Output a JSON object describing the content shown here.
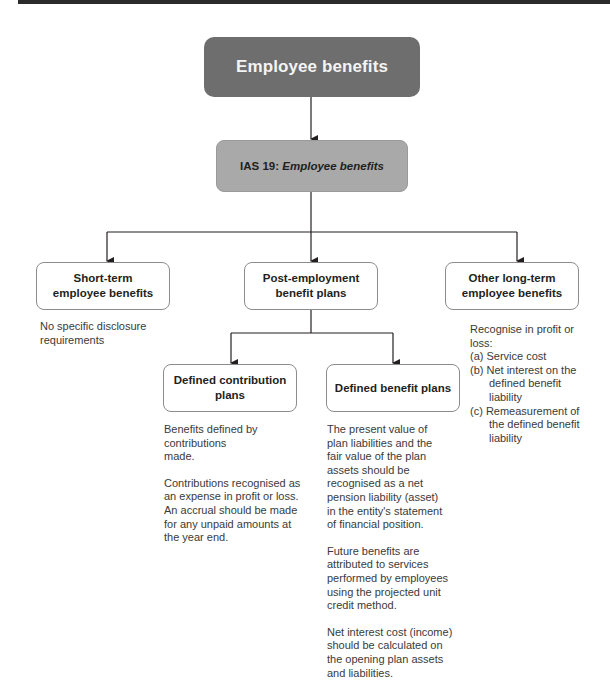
{
  "diagram": {
    "root": {
      "label": "Employee benefits"
    },
    "standard": {
      "prefix": "IAS 19: ",
      "title_italic": "Employee benefits"
    },
    "categories": [
      {
        "label": "Short-term employee benefits",
        "description": [
          "No specific disclosure requirements"
        ]
      },
      {
        "label": "Post-employment benefit plans",
        "children": [
          {
            "label": "Defined contribution plans",
            "description": [
              "Benefits defined by contributions made.",
              "Contributions recognised as an expense in profit or loss. An accrual should be made for any unpaid amounts at the year end."
            ]
          },
          {
            "label": "Defined benefit plans",
            "description": [
              "The present value of plan liabilities and the fair value of the plan assets should be recognised as a net pension liability (asset) in the entity's statement of financial position.",
              "Future benefits are attributed to services performed by employees using the projected unit credit method.",
              "Net interest cost (income) should be calculated on the opening plan assets and liabilities."
            ]
          }
        ]
      },
      {
        "label": "Other long-term employee benefits",
        "description_intro": "Recognise in profit or loss:",
        "description_items": [
          "(a) Service cost",
          "(b) Net interest on the defined benefit liability",
          "(c) Remeasurement of the defined benefit liability"
        ]
      }
    ]
  },
  "colors": {
    "root_fill": "#6e6e6e",
    "standard_fill": "#a9a9a9",
    "box_border": "#8c8c8c",
    "connector": "#231f20"
  }
}
